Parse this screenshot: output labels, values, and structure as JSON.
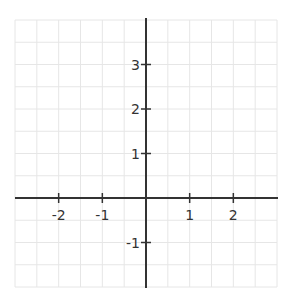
{
  "chart_data": {
    "type": "scatter",
    "title": "",
    "xlabel": "",
    "ylabel": "",
    "xlim": [
      -3,
      3
    ],
    "ylim": [
      -2,
      4
    ],
    "grid": true,
    "grid_step": 0.5,
    "x_ticks": [
      -2,
      -1,
      1,
      2
    ],
    "x_tick_labels": [
      "-2",
      "-1",
      "1",
      "2"
    ],
    "y_ticks": [
      3,
      2,
      1,
      -1
    ],
    "y_tick_labels": [
      "3",
      "2",
      "1",
      "-1"
    ],
    "series": [],
    "colors": {
      "grid": "#e6e6e6",
      "axis": "#333333"
    }
  }
}
